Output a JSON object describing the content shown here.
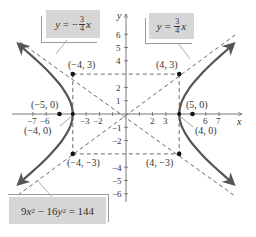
{
  "figure": {
    "equation_callout": {
      "lhs_a": "9",
      "var_x": "x",
      "exp": "2",
      "minus": " − 16",
      "var_y": "y",
      "exp2": "2",
      "rhs": " = 144"
    },
    "asymptote_neg_callout": {
      "y": "y",
      "eq": " = −",
      "num": "3",
      "den": "4",
      "x": "x"
    },
    "asymptote_pos_callout": {
      "y": "y",
      "eq": " = ",
      "num": "3",
      "den": "4",
      "x": "x"
    },
    "axes": {
      "x_label": "x",
      "y_label": "y",
      "x_ticks_neg": [
        "−7",
        "−6",
        "−3",
        "−2"
      ],
      "x_ticks_pos": [
        "2",
        "3",
        "6",
        "7"
      ],
      "y_ticks_pos": [
        "1",
        "2",
        "4",
        "5",
        "6"
      ],
      "y_ticks_neg": [
        "−1",
        "−2",
        "−4",
        "−5",
        "−6"
      ]
    },
    "points": {
      "p_neg4_3": "(−4, 3)",
      "p_4_3": "(4, 3)",
      "p_neg4_neg3": "(−4, −3)",
      "p_4_neg3": "(4, −3)",
      "p_neg5_0": "(−5, 0)",
      "p_5_0": "(5, 0)",
      "p_neg4_0": "(−4, 0)",
      "p_4_0": "(4, 0)"
    },
    "colors": {
      "curve": "#555555",
      "callout_fill": "#d6d6d6",
      "dash": "#444444"
    }
  }
}
